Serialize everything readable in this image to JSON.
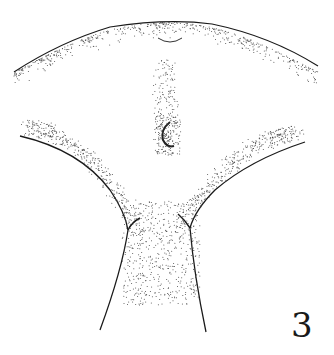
{
  "figure": {
    "label": "3",
    "ink_color": "#1a1a1a",
    "background": "#ffffff"
  }
}
